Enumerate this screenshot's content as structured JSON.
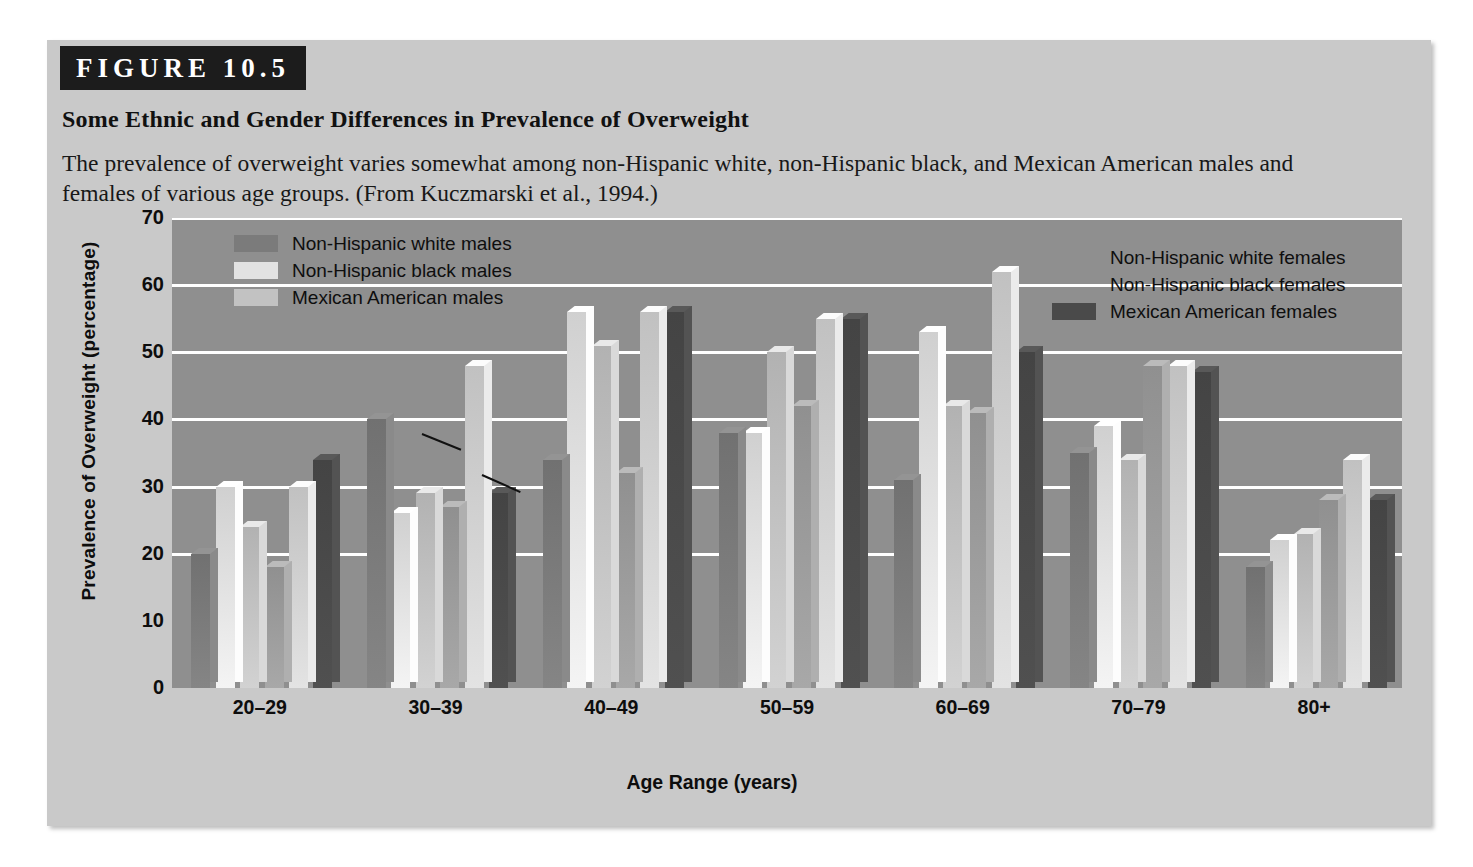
{
  "figure": {
    "label": "FIGURE 10.5",
    "title": "Some Ethnic and Gender Differences in Prevalence of Overweight",
    "caption": "The prevalence of overweight varies somewhat among non-Hispanic white, non-Hispanic black, and Mexican American males and females of various age groups. (From Kuczmarski et al., 1994.)"
  },
  "colors": {
    "panel_background": "#c9c9c9",
    "label_bar": "#1c1c1c",
    "plot_background": "#8f8f8f",
    "gridline": "#ffffff",
    "series_nhw_male": "#7b7b7b",
    "series_nhb_male": "#e2e2e2",
    "series_ma_male": "#c2c2c2",
    "series_nhw_female": "#9c9c9c",
    "series_nhb_female": "#d2d2d2",
    "series_ma_female": "#4a4a4a"
  },
  "legend_left": {
    "items": [
      {
        "label": "Non-Hispanic white males",
        "swatch": "#7b7b7b"
      },
      {
        "label": "Non-Hispanic black males",
        "swatch": "#e2e2e2"
      },
      {
        "label": "Mexican American males",
        "swatch": "#c2c2c2"
      }
    ]
  },
  "legend_right": {
    "items": [
      {
        "label": "Non-Hispanic white females",
        "swatch": "#9c9c9c"
      },
      {
        "label": "Non-Hispanic black females",
        "swatch": "#d2d2d2"
      },
      {
        "label": "Mexican American females",
        "swatch": "#4a4a4a"
      }
    ]
  },
  "chart_data": {
    "type": "bar",
    "title": "Some Ethnic and Gender Differences in Prevalence of Overweight",
    "xlabel": "Age Range (years)",
    "ylabel": "Prevalence of Overweight (percentage)",
    "ylim": [
      0,
      70
    ],
    "yticks": [
      0,
      10,
      20,
      30,
      40,
      50,
      60,
      70
    ],
    "grid": true,
    "legend_position": "inside-top-left and inside-top-right",
    "categories": [
      "20–29",
      "30–39",
      "40–49",
      "50–59",
      "60–69",
      "70–79",
      "80+"
    ],
    "series": [
      {
        "name": "Non-Hispanic white males",
        "values": [
          20,
          40,
          34,
          38,
          31,
          35,
          18
        ]
      },
      {
        "name": "Non-Hispanic black males",
        "values": [
          30,
          26,
          56,
          38,
          53,
          39,
          22
        ]
      },
      {
        "name": "Mexican American males",
        "values": [
          24,
          29,
          51,
          50,
          42,
          34,
          23
        ]
      },
      {
        "name": "Non-Hispanic white females",
        "values": [
          18,
          27,
          32,
          42,
          41,
          48,
          28
        ]
      },
      {
        "name": "Non-Hispanic black females",
        "values": [
          30,
          48,
          56,
          55,
          62,
          48,
          34
        ]
      },
      {
        "name": "Mexican American females",
        "values": [
          34,
          29,
          56,
          55,
          50,
          47,
          28
        ]
      }
    ]
  }
}
